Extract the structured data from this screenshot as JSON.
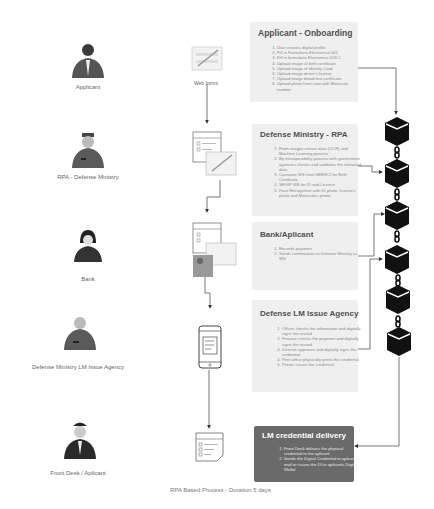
{
  "caption": "RPA Based Process - Duration 5 days",
  "actors": [
    {
      "label": "Applicant",
      "icon": "businessman-icon"
    },
    {
      "label": "RPA - Defense Ministry",
      "icon": "officer-icon"
    },
    {
      "label": "Bank",
      "icon": "businesswoman-icon"
    },
    {
      "label": "Defense Ministry LM Issue Agency",
      "icon": "officer-icon"
    },
    {
      "label": "Front Desk / Aplicant",
      "icon": "pilot-icon"
    }
  ],
  "documents": [
    {
      "label": "Web forms",
      "icon": "web-form-icon"
    },
    {
      "label": "",
      "icon": "checklist-form-icon"
    },
    {
      "label": "",
      "icon": "checklist-map-icon"
    },
    {
      "label": "",
      "icon": "mobile-checklist-icon"
    },
    {
      "label": "",
      "icon": "checklist-note-icon"
    }
  ],
  "steps": [
    {
      "title": "Applicant - Onboarding",
      "items": [
        "User creates digital profile",
        "Fill in Formulario Electronico 001",
        "Fill in formulario Electronico 003-C",
        "Upload image of birth certificate",
        "Upload image of Identity Card",
        "Upload image driver's license",
        "Upload image blood test certificate",
        "Upload photo front view with Matricula number"
      ]
    },
    {
      "title": "Defense Ministry - RPA",
      "items": [
        "From images extract data (OCR) and Machine Learning process",
        "By interoperability process with government agencies checks and validates the extracted data",
        "Consume WS from SERECI for Birth Certificate",
        "SEGIP WS for ID and License",
        "Face Recognition with ID photo, license's photo and Matricula's photo"
      ]
    },
    {
      "title": "Bank/Aplicant",
      "items": [
        "Records payment",
        "Sends confirmation to Defense Ministry as WS"
      ]
    },
    {
      "title": "Defense LM Issue Agency",
      "items": [
        "Officer checks the information and digitally signs the record",
        "Finance checks the payment and digitally signs the record",
        "Director approves and digitally signs the credential",
        "Print office physically prints the credential",
        "Printer issues the credential"
      ]
    },
    {
      "title": "LM credential delivery",
      "items": [
        "Front Desk delivers the physical credential to the aplicant",
        "Sends the Digital Credential to aplicants mail or issues the DI to aplicants Digital Wallet"
      ]
    }
  ],
  "blockchain": {
    "blocks": 6,
    "icon": "blockchain-block-icon",
    "link_icon": "chain-link-icon"
  },
  "colors": {
    "box_bg": "#efefef",
    "dark_box_bg": "#6a6a6a",
    "block": "#111111",
    "line": "#555555"
  }
}
